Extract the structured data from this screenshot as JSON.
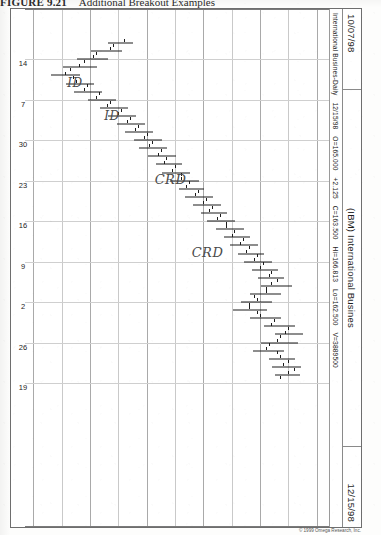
{
  "figure": {
    "number": "FIGURE 9.21",
    "title": "Additional Breakout Examples"
  },
  "sheet": {
    "header": {
      "date_left": "10/07/98",
      "symbol_name": "(IBM) International Busines",
      "date_right": "12/15/98"
    },
    "quote_line": {
      "instrument": "International Busines-Daily",
      "date": "12/15/98",
      "open_label": "O=165.000",
      "change": "+2.125",
      "close_label": "C=163.500",
      "high_label": "Hi=166.813",
      "low_label": "Lo=162.500",
      "volume_label": "V=3889500"
    },
    "credit": "© 1999 Omega Research, Inc."
  },
  "annotations": [
    {
      "id": "crd-1",
      "text": "CRD"
    },
    {
      "id": "crd-2",
      "text": "CRD"
    },
    {
      "id": "id-1",
      "text": "ID"
    },
    {
      "id": "id-2",
      "text": "ID"
    }
  ],
  "chart_data": {
    "type": "bar",
    "chart_style": "ohlc-bar",
    "title": "(IBM) International Busines",
    "subtitle": "International Busines-Daily  12/15/98  O=165.000  +2.125  C=163.500  Hi=166.813  Lo=162.500  V=3889500",
    "xlabel": "",
    "ylabel": "Price",
    "ylim": [
      118,
      172
    ],
    "yticks": [
      170,
      165,
      160,
      155,
      150,
      145,
      140,
      135,
      130,
      125,
      120
    ],
    "ytick_labels": [
      "170",
      "165",
      "160",
      "155",
      "150",
      "145",
      "140",
      "135",
      "130",
      "125",
      "120"
    ],
    "xticks": [
      2,
      7,
      12,
      17,
      22,
      27,
      32,
      37,
      42
    ],
    "xtick_labels": [
      "14",
      "7",
      "30",
      "23",
      "16",
      "9",
      "2",
      "26",
      "19"
    ],
    "grid": true,
    "legend": false,
    "x_date_start": "10/07/98",
    "x_date_end": "12/15/98",
    "ohlc": [
      {
        "i": 0,
        "open": 136.0,
        "high": 137.5,
        "low": 133.0,
        "close": 134.0
      },
      {
        "i": 1,
        "open": 133.5,
        "high": 135.5,
        "low": 130.0,
        "close": 131.0
      },
      {
        "i": 2,
        "open": 130.5,
        "high": 133.0,
        "low": 127.5,
        "close": 129.0
      },
      {
        "i": 3,
        "open": 128.0,
        "high": 131.0,
        "low": 125.0,
        "close": 126.5
      },
      {
        "i": 4,
        "open": 125.5,
        "high": 128.0,
        "low": 123.0,
        "close": 127.0
      },
      {
        "i": 5,
        "open": 127.5,
        "high": 130.5,
        "low": 125.5,
        "close": 129.5
      },
      {
        "i": 6,
        "open": 129.0,
        "high": 132.0,
        "low": 127.0,
        "close": 131.5
      },
      {
        "i": 7,
        "open": 131.0,
        "high": 134.5,
        "low": 129.5,
        "close": 133.5
      },
      {
        "i": 8,
        "open": 133.0,
        "high": 136.5,
        "low": 131.5,
        "close": 135.5
      },
      {
        "i": 9,
        "open": 135.0,
        "high": 138.0,
        "low": 133.0,
        "close": 137.0
      },
      {
        "i": 10,
        "open": 136.5,
        "high": 139.5,
        "low": 134.5,
        "close": 138.5
      },
      {
        "i": 11,
        "open": 138.0,
        "high": 141.0,
        "low": 136.0,
        "close": 140.0
      },
      {
        "i": 12,
        "open": 139.5,
        "high": 142.5,
        "low": 137.5,
        "close": 141.0
      },
      {
        "i": 13,
        "open": 140.5,
        "high": 143.5,
        "low": 138.5,
        "close": 142.5
      },
      {
        "i": 14,
        "open": 142.0,
        "high": 145.0,
        "low": 140.0,
        "close": 143.5
      },
      {
        "i": 15,
        "open": 143.0,
        "high": 146.0,
        "low": 141.5,
        "close": 145.0
      },
      {
        "i": 16,
        "open": 144.5,
        "high": 147.5,
        "low": 142.5,
        "close": 146.0
      },
      {
        "i": 17,
        "open": 146.0,
        "high": 149.0,
        "low": 144.0,
        "close": 147.5
      },
      {
        "i": 18,
        "open": 147.0,
        "high": 150.0,
        "low": 145.5,
        "close": 149.0
      },
      {
        "i": 19,
        "open": 148.5,
        "high": 151.5,
        "low": 146.5,
        "close": 150.5
      },
      {
        "i": 20,
        "open": 150.0,
        "high": 153.0,
        "low": 148.0,
        "close": 151.5
      },
      {
        "i": 21,
        "open": 151.0,
        "high": 154.0,
        "low": 149.5,
        "close": 153.0
      },
      {
        "i": 22,
        "open": 152.5,
        "high": 155.5,
        "low": 150.5,
        "close": 154.0
      },
      {
        "i": 23,
        "open": 154.0,
        "high": 157.0,
        "low": 152.0,
        "close": 155.5
      },
      {
        "i": 24,
        "open": 155.0,
        "high": 158.0,
        "low": 153.5,
        "close": 157.0
      },
      {
        "i": 25,
        "open": 156.5,
        "high": 159.5,
        "low": 154.5,
        "close": 158.0
      },
      {
        "i": 26,
        "open": 157.5,
        "high": 160.5,
        "low": 156.0,
        "close": 159.5
      },
      {
        "i": 27,
        "open": 159.0,
        "high": 162.0,
        "low": 157.0,
        "close": 160.5
      },
      {
        "i": 28,
        "open": 160.0,
        "high": 163.0,
        "low": 158.5,
        "close": 162.0
      },
      {
        "i": 29,
        "open": 161.5,
        "high": 164.0,
        "low": 159.5,
        "close": 163.0
      },
      {
        "i": 30,
        "open": 162.0,
        "high": 165.5,
        "low": 160.0,
        "close": 161.0
      },
      {
        "i": 31,
        "open": 161.0,
        "high": 163.5,
        "low": 158.0,
        "close": 159.0
      },
      {
        "i": 32,
        "open": 159.5,
        "high": 162.0,
        "low": 156.5,
        "close": 158.0
      },
      {
        "i": 33,
        "open": 158.0,
        "high": 161.0,
        "low": 155.0,
        "close": 159.5
      },
      {
        "i": 34,
        "open": 160.0,
        "high": 163.5,
        "low": 158.0,
        "close": 162.5
      },
      {
        "i": 35,
        "open": 162.0,
        "high": 166.0,
        "low": 160.5,
        "close": 165.0
      },
      {
        "i": 36,
        "open": 164.5,
        "high": 167.5,
        "low": 162.5,
        "close": 163.5
      },
      {
        "i": 37,
        "open": 163.0,
        "high": 166.5,
        "low": 160.0,
        "close": 161.5
      },
      {
        "i": 38,
        "open": 161.0,
        "high": 164.0,
        "low": 158.5,
        "close": 163.0
      },
      {
        "i": 39,
        "open": 163.5,
        "high": 166.0,
        "low": 161.5,
        "close": 165.0
      },
      {
        "i": 40,
        "open": 164.0,
        "high": 167.0,
        "low": 162.0,
        "close": 166.0
      },
      {
        "i": 41,
        "open": 165.0,
        "high": 166.8,
        "low": 162.5,
        "close": 163.5
      }
    ]
  }
}
